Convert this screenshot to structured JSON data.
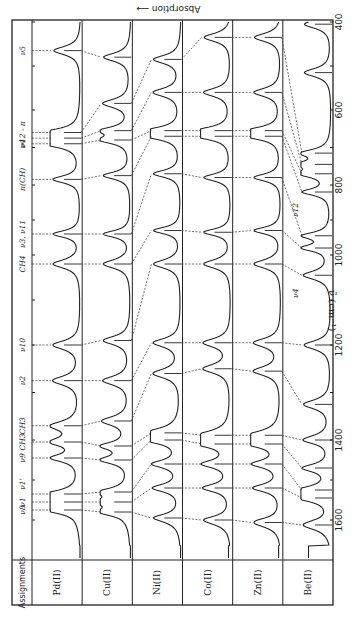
{
  "chart_data": {
    "type": "line",
    "title": "",
    "orientation": "rotated 90° clockwise (wavenumber axis vertical, panels side by side)",
    "xlabel": "ν̃ (cm⁻¹)",
    "ylabel": "Absorption",
    "ylabel_arrow": "←",
    "xlim": [
      1650,
      400
    ],
    "x_ticks": [
      1600,
      1400,
      1200,
      1000,
      800,
      600,
      400
    ],
    "x_minor_ticks": [
      1500,
      1300,
      1100,
      900,
      700,
      500
    ],
    "assignments_header": "Assignments",
    "panels": [
      "Pd(II)",
      "Cu(II)",
      "Ni(II)",
      "Co(II)",
      "Zn(II)",
      "Be(II)"
    ],
    "assignments": [
      {
        "label": "ν8",
        "x": 1575
      },
      {
        "label": "ν1",
        "x": 1555
      },
      {
        "label": "ν1'",
        "x": 1510
      },
      {
        "label": "ν9",
        "x": 1445
      },
      {
        "label": "CH3",
        "x": 1405
      },
      {
        "label": "CH3",
        "x": 1370
      },
      {
        "label": "ν2",
        "x": 1275
      },
      {
        "label": "ν10",
        "x": 1200
      },
      {
        "label": "CH4",
        "x": 1020
      },
      {
        "label": "ν3, ν11",
        "x": 940
      },
      {
        "label": "π(CH)",
        "x": 785
      },
      {
        "label": "ν4",
        "x": 690
      },
      {
        "label": "ν12 - π",
        "x": 665
      },
      {
        "label": "ν5",
        "x": 465
      }
    ],
    "series": [
      {
        "name": "Pd(II)",
        "peaks": [
          1575,
          1555,
          1535,
          1445,
          1405,
          1370,
          1275,
          1200,
          1020,
          940,
          785,
          690,
          675,
          660,
          465
        ]
      },
      {
        "name": "Cu(II)",
        "peaks": [
          1580,
          1555,
          1530,
          1450,
          1415,
          1360,
          1275,
          1190,
          1020,
          940,
          775,
          680,
          655,
          585,
          480
        ]
      },
      {
        "name": "Ni(II)",
        "peaks": [
          1595,
          1520,
          1460,
          1400,
          1385,
          1260,
          1195,
          1020,
          930,
          770,
          670,
          655,
          560,
          485
        ]
      },
      {
        "name": "Co(II)",
        "peaks": [
          1600,
          1520,
          1460,
          1410,
          1390,
          1250,
          1195,
          1020,
          935,
          780,
          670,
          655,
          560,
          435
        ]
      },
      {
        "name": "Zn(II)",
        "peaks": [
          1605,
          1520,
          1460,
          1410,
          1390,
          1255,
          1195,
          1020,
          930,
          780,
          670,
          655,
          560,
          435
        ]
      },
      {
        "name": "Be(II)",
        "peaks": [
          1610,
          1545,
          1525,
          1470,
          1400,
          1325,
          1200,
          1045,
          980,
          945,
          820,
          770,
          745,
          715,
          515,
          405
        ],
        "labels": [
          {
            "label": "ν4",
            "x": 1045
          },
          {
            "label": "ν12",
            "x": 820
          }
        ]
      }
    ],
    "grid": false,
    "legend": "none"
  }
}
